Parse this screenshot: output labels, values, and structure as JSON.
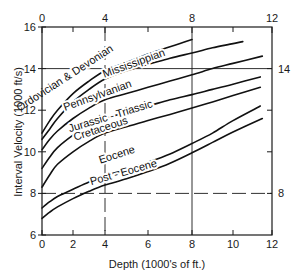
{
  "chart_data": {
    "type": "line",
    "title": "",
    "xlabel": "Depth  (1000's of ft.)",
    "ylabel": "Interval Velocity  (1000 ft/s)",
    "xlim": [
      0,
      12
    ],
    "ylim": [
      6,
      16
    ],
    "grid": "partial",
    "x_ticks_bottom": [
      0,
      2,
      4,
      6,
      8,
      10,
      12
    ],
    "x_ticks_top_labeled": [
      0,
      4,
      8,
      12
    ],
    "x_ticks_top_minor": [
      2,
      6,
      10
    ],
    "y_ticks_left": [
      6,
      8,
      10,
      12,
      14,
      16
    ],
    "y_ticks_right_labeled": [
      14,
      8
    ],
    "y_ticks_right_minor": [
      12,
      10
    ],
    "series": [
      {
        "name": "Ordovician & Devonian",
        "x": [
          0,
          0.5,
          1,
          2,
          3,
          4,
          5,
          6,
          7,
          8
        ],
        "values": [
          10.9,
          11.5,
          12.0,
          12.8,
          13.4,
          13.9,
          14.3,
          14.7,
          15.05,
          15.4
        ]
      },
      {
        "name": "Mississippian",
        "x": [
          0,
          0.5,
          1,
          2,
          3,
          4,
          5,
          6,
          7,
          8,
          9,
          10,
          10.5
        ],
        "values": [
          10.6,
          11.1,
          11.6,
          12.4,
          13.0,
          13.5,
          13.9,
          14.2,
          14.5,
          14.75,
          15.0,
          15.2,
          15.3
        ]
      },
      {
        "name": "Pennsylvanian",
        "x": [
          0,
          0.5,
          1,
          2,
          3,
          4,
          5,
          6,
          7,
          8,
          9,
          10,
          11.5
        ],
        "values": [
          10.1,
          10.6,
          11.0,
          11.6,
          12.1,
          12.5,
          12.8,
          13.1,
          13.4,
          13.7,
          14.0,
          14.25,
          14.6
        ]
      },
      {
        "name": "Jurassic-Triassic",
        "x": [
          0,
          0.5,
          1,
          2,
          3,
          4,
          5,
          6,
          7,
          8,
          9,
          10,
          11.4
        ],
        "values": [
          9.2,
          9.75,
          10.2,
          10.8,
          11.3,
          11.6,
          11.9,
          12.2,
          12.5,
          12.75,
          13.0,
          13.25,
          13.6
        ]
      },
      {
        "name": "Cretaceous",
        "x": [
          0,
          0.5,
          1,
          2,
          3,
          4,
          5,
          6,
          7,
          8,
          9,
          10,
          11.4
        ],
        "values": [
          8.3,
          8.9,
          9.4,
          10.0,
          10.5,
          10.9,
          11.2,
          11.5,
          11.8,
          12.1,
          12.4,
          12.7,
          13.1
        ]
      },
      {
        "name": "Eocene",
        "x": [
          0,
          0.5,
          1,
          2,
          3,
          4,
          5,
          6,
          7,
          8,
          9,
          10,
          11.4
        ],
        "values": [
          7.3,
          7.6,
          7.85,
          8.2,
          8.55,
          8.85,
          9.15,
          9.5,
          9.9,
          10.4,
          10.9,
          11.5,
          12.2
        ]
      },
      {
        "name": "Post - Eocene",
        "x": [
          0,
          0.5,
          1,
          2,
          3,
          4,
          5,
          6,
          7,
          8,
          9,
          10,
          11.5
        ],
        "values": [
          6.8,
          7.1,
          7.35,
          7.75,
          8.1,
          8.4,
          8.7,
          9.05,
          9.45,
          9.95,
          10.45,
          10.95,
          11.6
        ]
      }
    ],
    "annotations": [
      {
        "text": "Ordovician & Devonian",
        "x": 1.6,
        "y": 13.4,
        "angle": -33
      },
      {
        "text": "Mississippian",
        "x": 5.4,
        "y": 14.1,
        "angle": -20
      },
      {
        "text": "Pennsylvanian",
        "x": 3.6,
        "y": 12.55,
        "angle": -20
      },
      {
        "text": "Jurassic - Triassic",
        "x": 4.3,
        "y": 11.55,
        "angle": -17
      },
      {
        "text": "Cretaceous",
        "x": 3.8,
        "y": 10.95,
        "angle": -18
      },
      {
        "text": "Eocene",
        "x": 4.6,
        "y": 9.7,
        "angle": -18
      },
      {
        "text": "Post - Eocene",
        "x": 4.9,
        "y": 8.85,
        "angle": -16
      }
    ],
    "dashed_reference_lines": [
      {
        "orientation": "vertical",
        "x": 4
      },
      {
        "orientation": "horizontal",
        "y": 8
      }
    ],
    "solid_reference_lines": [
      {
        "orientation": "vertical",
        "x": 8
      },
      {
        "orientation": "horizontal",
        "y": 14
      }
    ]
  }
}
